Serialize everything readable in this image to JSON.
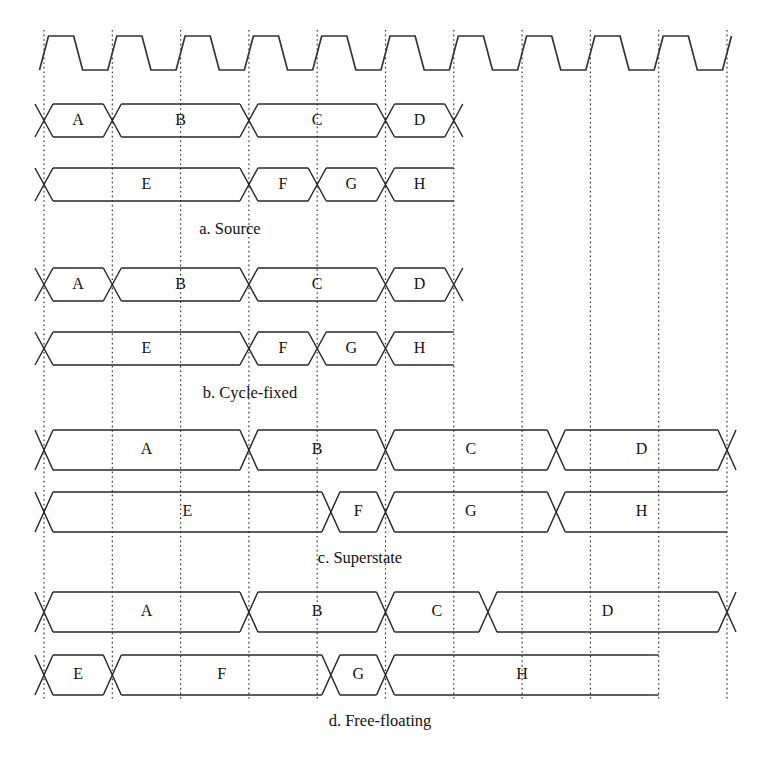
{
  "figure": {
    "width": 761,
    "height": 761,
    "background_color": "#ffffff",
    "stroke_color": "#262626",
    "gridline_color": "#2b2b2b",
    "text_color": "#111111"
  },
  "geometry": {
    "grid_origin_x": 44,
    "grid_step": 68.3,
    "grid_count": 11,
    "grid_top": 30,
    "grid_bottom": 700
  },
  "clock": {
    "name": "clock-waveform",
    "top_y": 36,
    "bottom_y": 70,
    "cycles": 10,
    "edge_slew": 9,
    "high_fraction": 0.5
  },
  "sections": [
    {
      "id": "a",
      "caption": "a. Source",
      "caption_x": 230,
      "caption_y": 230,
      "rows": [
        {
          "name": "row-upper",
          "top_y": 104,
          "bottom_y": 137,
          "closed_end": true,
          "segments": [
            {
              "label": "A",
              "start": 0,
              "end": 1
            },
            {
              "label": "B",
              "start": 1,
              "end": 3
            },
            {
              "label": "C",
              "start": 3,
              "end": 5
            },
            {
              "label": "D",
              "start": 5,
              "end": 6
            }
          ]
        },
        {
          "name": "row-lower",
          "top_y": 168,
          "bottom_y": 201,
          "closed_end": false,
          "segments": [
            {
              "label": "E",
              "start": 0,
              "end": 3
            },
            {
              "label": "F",
              "start": 3,
              "end": 4
            },
            {
              "label": "G",
              "start": 4,
              "end": 5
            },
            {
              "label": "H",
              "start": 5,
              "end": 6
            }
          ]
        }
      ]
    },
    {
      "id": "b",
      "caption": "b. Cycle-fixed",
      "caption_x": 250,
      "caption_y": 394,
      "rows": [
        {
          "name": "row-upper",
          "top_y": 268,
          "bottom_y": 301,
          "closed_end": true,
          "segments": [
            {
              "label": "A",
              "start": 0,
              "end": 1
            },
            {
              "label": "B",
              "start": 1,
              "end": 3
            },
            {
              "label": "C",
              "start": 3,
              "end": 5
            },
            {
              "label": "D",
              "start": 5,
              "end": 6
            }
          ]
        },
        {
          "name": "row-lower",
          "top_y": 332,
          "bottom_y": 365,
          "closed_end": false,
          "segments": [
            {
              "label": "E",
              "start": 0,
              "end": 3
            },
            {
              "label": "F",
              "start": 3,
              "end": 4
            },
            {
              "label": "G",
              "start": 4,
              "end": 5
            },
            {
              "label": "H",
              "start": 5,
              "end": 6
            }
          ]
        }
      ]
    },
    {
      "id": "c",
      "caption": "c. Superstate",
      "caption_x": 360,
      "caption_y": 559,
      "rows": [
        {
          "name": "row-upper",
          "top_y": 430,
          "bottom_y": 470,
          "closed_end": true,
          "segments": [
            {
              "label": "A",
              "start": 0,
              "end": 3
            },
            {
              "label": "B",
              "start": 3,
              "end": 5
            },
            {
              "label": "C",
              "start": 5,
              "end": 7.5
            },
            {
              "label": "D",
              "start": 7.5,
              "end": 10
            }
          ]
        },
        {
          "name": "row-lower",
          "top_y": 492,
          "bottom_y": 532,
          "closed_end": false,
          "segments": [
            {
              "label": "E",
              "start": 0,
              "end": 4.2
            },
            {
              "label": "F",
              "start": 4.2,
              "end": 5
            },
            {
              "label": "G",
              "start": 5,
              "end": 7.5
            },
            {
              "label": "H",
              "start": 7.5,
              "end": 10
            }
          ]
        }
      ]
    },
    {
      "id": "d",
      "caption": "d. Free-floating",
      "caption_x": 380,
      "caption_y": 722,
      "rows": [
        {
          "name": "row-upper",
          "top_y": 592,
          "bottom_y": 632,
          "closed_end": true,
          "segments": [
            {
              "label": "A",
              "start": 0,
              "end": 3
            },
            {
              "label": "B",
              "start": 3,
              "end": 5
            },
            {
              "label": "C",
              "start": 5,
              "end": 6.5
            },
            {
              "label": "D",
              "start": 6.5,
              "end": 10
            }
          ]
        },
        {
          "name": "row-lower",
          "top_y": 655,
          "bottom_y": 695,
          "closed_end": false,
          "segments": [
            {
              "label": "E",
              "start": 0,
              "end": 1
            },
            {
              "label": "F",
              "start": 1,
              "end": 4.2
            },
            {
              "label": "G",
              "start": 4.2,
              "end": 5
            },
            {
              "label": "H",
              "start": 5,
              "end": 9
            }
          ]
        }
      ]
    }
  ]
}
